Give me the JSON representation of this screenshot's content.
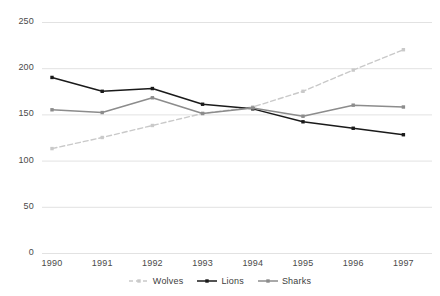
{
  "chart_data": {
    "type": "line",
    "title": "",
    "subtitle": "",
    "xlabel": "",
    "ylabel": "",
    "categories": [
      "1990",
      "1991",
      "1992",
      "1993",
      "1994",
      "1995",
      "1996",
      "1997"
    ],
    "x": [
      1990,
      1991,
      1992,
      1993,
      1994,
      1995,
      1996,
      1997
    ],
    "ylim": [
      0,
      250
    ],
    "yticks": [
      0,
      50,
      100,
      150,
      200,
      250
    ],
    "ytick_labels": [
      "0",
      "50",
      "100",
      "150",
      "200",
      "250"
    ],
    "grid": true,
    "grid_axis": "y",
    "legend_position": "bottom-center",
    "series": [
      {
        "name": "Wolves",
        "color": "#c9c9c9",
        "line_style": "dashed",
        "marker": "square",
        "values": [
          113,
          125,
          138,
          151,
          158,
          175,
          198,
          220
        ]
      },
      {
        "name": "Lions",
        "color": "#1a1a1a",
        "line_style": "solid",
        "marker": "square",
        "values": [
          190,
          175,
          178,
          161,
          156,
          142,
          135,
          128
        ]
      },
      {
        "name": "Sharks",
        "color": "#8c8c8c",
        "line_style": "solid",
        "marker": "square",
        "values": [
          155,
          152,
          168,
          151,
          157,
          148,
          160,
          158
        ]
      }
    ]
  },
  "axis": {
    "gridline_color": "#e2e2e2",
    "tick_color": "#4a4a4a"
  },
  "legend": {
    "entries": [
      {
        "label": "Wolves"
      },
      {
        "label": "Lions"
      },
      {
        "label": "Sharks"
      }
    ]
  }
}
